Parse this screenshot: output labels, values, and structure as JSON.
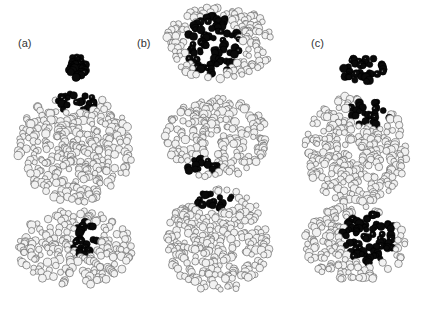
{
  "figure": {
    "panels": [
      {
        "id": "a",
        "label": "(a)",
        "x": 18,
        "y": 37
      },
      {
        "id": "b",
        "label": "(b)",
        "x": 137,
        "y": 37
      },
      {
        "id": "c",
        "label": "(c)",
        "x": 311,
        "y": 37
      }
    ],
    "colors": {
      "background": "#ffffff",
      "atom_fill": "#f2f2f2",
      "atom_stroke": "#555555",
      "ligand": "#0a0a0a"
    },
    "models": [
      {
        "name": "a-ligand",
        "type": "ligand",
        "cx": 77,
        "cy": 67,
        "rx": 9,
        "ry": 12
      },
      {
        "name": "a-protein-top",
        "type": "protein",
        "cx": 75,
        "cy": 148,
        "rx": 58,
        "ry": 55,
        "site": {
          "cx": 78,
          "cy": 103,
          "rx": 22,
          "ry": 10
        }
      },
      {
        "name": "a-protein-bottom",
        "type": "protein",
        "cx": 75,
        "cy": 248,
        "rx": 58,
        "ry": 38,
        "site": {
          "cx": 85,
          "cy": 240,
          "rx": 13,
          "ry": 18
        }
      },
      {
        "name": "b-protein-top",
        "type": "protein",
        "cx": 220,
        "cy": 43,
        "rx": 55,
        "ry": 37,
        "site": {
          "cx": 213,
          "cy": 45,
          "rx": 27,
          "ry": 30
        }
      },
      {
        "name": "b-protein-middle",
        "type": "protein",
        "cx": 216,
        "cy": 138,
        "rx": 52,
        "ry": 40,
        "site": {
          "cx": 200,
          "cy": 167,
          "rx": 18,
          "ry": 8
        }
      },
      {
        "name": "b-protein-bottom",
        "type": "protein",
        "cx": 218,
        "cy": 240,
        "rx": 52,
        "ry": 52,
        "site": {
          "cx": 212,
          "cy": 200,
          "rx": 24,
          "ry": 9
        }
      },
      {
        "name": "c-ligand",
        "type": "ligand",
        "cx": 363,
        "cy": 70,
        "rx": 22,
        "ry": 13
      },
      {
        "name": "c-protein-top",
        "type": "protein",
        "cx": 355,
        "cy": 150,
        "rx": 52,
        "ry": 55,
        "site": {
          "cx": 370,
          "cy": 113,
          "rx": 21,
          "ry": 13
        }
      },
      {
        "name": "c-protein-bottom",
        "type": "protein",
        "cx": 355,
        "cy": 243,
        "rx": 52,
        "ry": 38,
        "site": {
          "cx": 370,
          "cy": 238,
          "rx": 28,
          "ry": 26
        }
      }
    ]
  }
}
